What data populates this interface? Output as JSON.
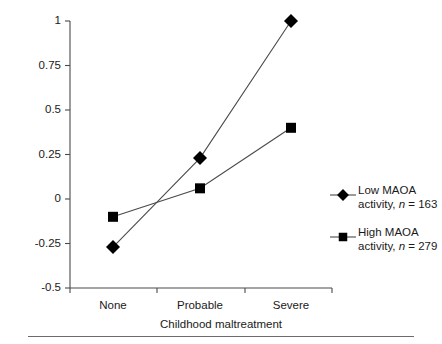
{
  "chart_data": {
    "type": "line",
    "title": "",
    "xlabel": "Childhood maltreatment",
    "ylabel": "Composite index of\nantisocial behavior (z scores)",
    "categories": [
      "None",
      "Probable",
      "Severe"
    ],
    "ylim": [
      -0.5,
      1
    ],
    "yticks": [
      -0.5,
      -0.25,
      0,
      0.25,
      0.5,
      0.75,
      1
    ],
    "ytick_labels": [
      "-0.5",
      "-0.25",
      "0",
      "0.25",
      "0.5",
      "0.75",
      "1"
    ],
    "grid": false,
    "legend_position": "right",
    "series": [
      {
        "name": "Low MAOA activity, n = 163",
        "marker": "diamond",
        "values": [
          -0.27,
          0.23,
          1.0
        ]
      },
      {
        "name": "High MAOA activity, n = 279",
        "marker": "square",
        "values": [
          -0.1,
          0.06,
          0.4
        ]
      }
    ]
  },
  "legend": {
    "entries": [
      {
        "marker": "diamond",
        "line1": "Low MAOA",
        "line2_pre": "activity, ",
        "line2_n": "n",
        "line2_post": " = 163"
      },
      {
        "marker": "square",
        "line1": "High MAOA",
        "line2_pre": "activity, ",
        "line2_n": "n",
        "line2_post": " = 279"
      }
    ]
  },
  "axes": {
    "x_label": "Childhood maltreatment",
    "y_label_line1": "Composite index of",
    "y_label_line2": "antisocial behavior (z scores)",
    "x_tick_labels": [
      "None",
      "Probable",
      "Severe"
    ],
    "y_tick_labels": [
      "1",
      "0.75",
      "0.5",
      "0.25",
      "0",
      "-0.25",
      "-0.5"
    ]
  },
  "colors": {
    "marker": "#000000",
    "axis": "#4a4a4a",
    "line": "#4a4a4a",
    "text": "#1a1a1a",
    "background": "#ffffff",
    "rule": "#6b6b6b"
  }
}
